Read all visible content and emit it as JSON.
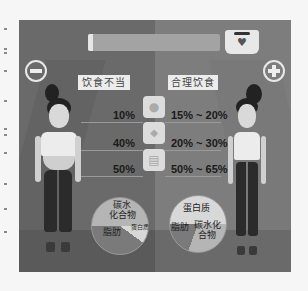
{
  "scene": {
    "labels": {
      "bad_diet": "饮食不当",
      "good_diet": "合理饮食"
    },
    "buttons": {
      "minus": "−",
      "plus": "+"
    },
    "health_bar": {
      "icon": "heart-icon",
      "heart_glyph": "♥"
    },
    "nutrients": [
      {
        "icon": "egg-icon",
        "glyph": "●",
        "bad": "10%",
        "good": "15% ~ 20%"
      },
      {
        "icon": "oil-drop-icon",
        "glyph": "💧",
        "bad": "40%",
        "good": "20% ~ 30%"
      },
      {
        "icon": "grain-jar-icon",
        "glyph": "▤",
        "bad": "50%",
        "good": "50% ~ 65%"
      }
    ],
    "pie_bad": {
      "carb": "碳水化合物",
      "carb_l1": "碳水",
      "carb_l2": "化合物",
      "fat": "脂肪",
      "protein": "蛋白质"
    },
    "pie_good": {
      "protein": "蛋白质",
      "fat": "脂肪",
      "carb_l1": "碳水化",
      "carb_l2": "合物"
    }
  },
  "colors": {
    "frame_left": "#6a6a6a",
    "frame_right": "#7d7d7d",
    "label_bg": "#ececec",
    "pie_carb": "#b5b5b5",
    "pie_fat": "#7a7a7a",
    "pie_protein": "#d8d8d8"
  }
}
